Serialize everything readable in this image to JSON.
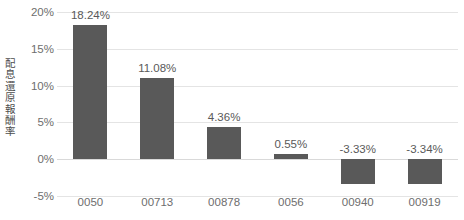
{
  "chart_data": {
    "type": "bar",
    "title": "",
    "xlabel": "",
    "ylabel": "配息還原報酬率",
    "categories": [
      "0050",
      "00713",
      "00878",
      "0056",
      "00940",
      "00919"
    ],
    "values": [
      18.24,
      11.08,
      4.36,
      0.55,
      -3.33,
      -3.34
    ],
    "data_labels": [
      "18.24%",
      "11.08%",
      "4.36%",
      "0.55%",
      "-3.33%",
      "-3.34%"
    ],
    "series": [
      {
        "name": "配息還原報酬率",
        "values": [
          18.24,
          11.08,
          4.36,
          0.55,
          -3.33,
          -3.34
        ]
      }
    ],
    "ylim": [
      -5,
      20
    ],
    "y_ticks": [
      20,
      15,
      10,
      5,
      0,
      -5
    ],
    "y_tick_labels": [
      "20%",
      "15%",
      "10%",
      "5%",
      "0%",
      "-5%"
    ],
    "grid": true,
    "legend": "none",
    "bar_color": "#595959",
    "gridline_color": "#e4e4e4",
    "axis_text_color": "#6e6e6e",
    "background_color": "#ffffff"
  },
  "ylabel_chars": [
    "配",
    "息",
    "還",
    "原",
    "報",
    "酬",
    "率"
  ]
}
